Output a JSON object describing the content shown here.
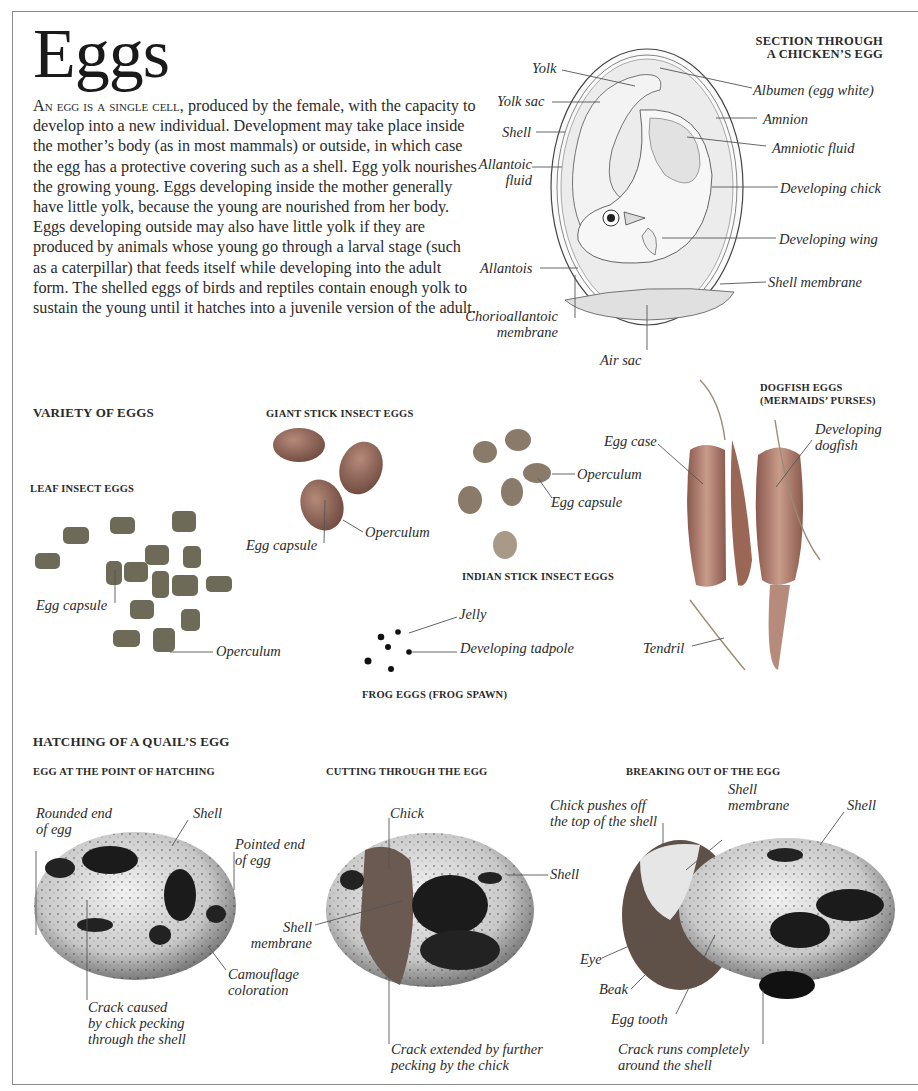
{
  "page": {
    "title": "Eggs",
    "intro": {
      "lead": "An egg is a single cell",
      "body": ", produced by the female, with the capacity to develop into a new individual. Development may take place inside the mother’s body (as in most mammals) or outside, in which case the egg has a protective covering such as a shell. Egg yolk nourishes the growing young. Eggs developing inside the mother generally have little yolk, because the young are nourished from her body. Eggs developing outside may also have little yolk if they are produced by animals whose young go through a larval stage (such as a caterpillar) that feeds itself while developing into the adult form. The shelled eggs of birds and reptiles contain enough yolk to sustain the young until it hatches into a juvenile version of the adult."
    }
  },
  "chicken_egg": {
    "heading_line1": "SECTION THROUGH",
    "heading_line2": "A CHICKEN’S EGG",
    "labels": {
      "yolk": "Yolk",
      "yolk_sac": "Yolk sac",
      "shell": "Shell",
      "allantoic_fluid_1": "Allantoic",
      "allantoic_fluid_2": "fluid",
      "allantois": "Allantois",
      "chorioallantoic_1": "Chorioallantoic",
      "chorioallantoic_2": "membrane",
      "air_sac": "Air sac",
      "albumen": "Albumen (egg white)",
      "amnion": "Amnion",
      "amniotic_fluid": "Amniotic fluid",
      "developing_chick": "Developing chick",
      "developing_wing": "Developing wing",
      "shell_membrane": "Shell membrane"
    }
  },
  "variety": {
    "heading": "VARIETY OF EGGS",
    "leaf_insect": {
      "heading": "LEAF INSECT EGGS",
      "egg_capsule": "Egg capsule",
      "operculum": "Operculum"
    },
    "giant_stick_insect": {
      "heading": "GIANT STICK INSECT EGGS",
      "egg_capsule": "Egg capsule",
      "operculum": "Operculum"
    },
    "indian_stick_insect": {
      "heading": "INDIAN STICK INSECT EGGS",
      "operculum": "Operculum",
      "egg_capsule": "Egg capsule"
    },
    "frog": {
      "heading": "FROG EGGS (FROG SPAWN)",
      "jelly": "Jelly",
      "tadpole": "Developing tadpole"
    },
    "dogfish": {
      "heading_line1": "DOGFISH EGGS",
      "heading_line2": "(MERMAIDS’ PURSES)",
      "egg_case": "Egg case",
      "developing_1": "Developing",
      "developing_2": "dogfish",
      "tendril": "Tendril"
    }
  },
  "hatching": {
    "heading": "HATCHING OF A QUAIL’S EGG",
    "stage1": {
      "heading": "EGG AT THE POINT OF HATCHING",
      "rounded_1": "Rounded end",
      "rounded_2": "of egg",
      "shell": "Shell",
      "pointed_1": "Pointed end",
      "pointed_2": "of egg",
      "camo_1": "Camouflage",
      "camo_2": "coloration",
      "crack_1": "Crack caused",
      "crack_2": "by chick pecking",
      "crack_3": "through the shell"
    },
    "stage2": {
      "heading": "CUTTING THROUGH THE EGG",
      "chick": "Chick",
      "shell": "Shell",
      "membrane_1": "Shell",
      "membrane_2": "membrane",
      "crack_1": "Crack extended by further",
      "crack_2": "pecking by the chick"
    },
    "stage3": {
      "heading": "BREAKING OUT OF THE EGG",
      "pushes_1": "Chick pushes off",
      "pushes_2": "the top of the shell",
      "membrane_1": "Shell",
      "membrane_2": "membrane",
      "shell": "Shell",
      "eye": "Eye",
      "beak": "Beak",
      "egg_tooth": "Egg tooth",
      "crack_1": "Crack runs completely",
      "crack_2": "around the shell"
    }
  }
}
